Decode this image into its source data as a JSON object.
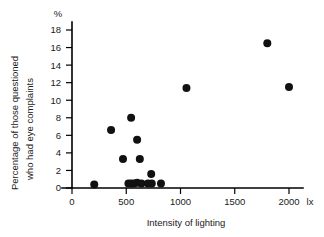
{
  "chart_data": {
    "type": "scatter",
    "title": "",
    "xlabel": "Intensity of lighting",
    "ylabel": "Percentage of those questioned who had eye complaints",
    "ylabel_line1": "Percentage of those questioned",
    "ylabel_line2": "who had eye complaints",
    "x_unit": "lx",
    "y_unit": "%",
    "xlim": [
      0,
      2150
    ],
    "ylim": [
      0,
      19
    ],
    "xticks": [
      0,
      500,
      1000,
      1500,
      2000
    ],
    "xtick_labels": [
      "0",
      "500",
      "1000",
      "1500",
      "2000"
    ],
    "yticks": [
      0,
      2,
      4,
      6,
      8,
      10,
      12,
      14,
      16,
      18
    ],
    "ytick_labels": [
      "0",
      "2",
      "4",
      "6",
      "8",
      "10",
      "12",
      "14",
      "16",
      "18"
    ],
    "grid": false,
    "legend": false,
    "marker": "filled-circle",
    "marker_color": "#111111",
    "marker_size": 5.2,
    "points": [
      {
        "x": 205,
        "y": 0.4
      },
      {
        "x": 360,
        "y": 6.6
      },
      {
        "x": 470,
        "y": 3.3
      },
      {
        "x": 545,
        "y": 8.0
      },
      {
        "x": 520,
        "y": 0.5
      },
      {
        "x": 545,
        "y": 0.5
      },
      {
        "x": 570,
        "y": 0.5
      },
      {
        "x": 600,
        "y": 0.6
      },
      {
        "x": 600,
        "y": 5.5
      },
      {
        "x": 625,
        "y": 3.3
      },
      {
        "x": 640,
        "y": 0.5
      },
      {
        "x": 700,
        "y": 0.5
      },
      {
        "x": 730,
        "y": 1.6
      },
      {
        "x": 735,
        "y": 0.5
      },
      {
        "x": 820,
        "y": 0.5
      },
      {
        "x": 1055,
        "y": 11.4
      },
      {
        "x": 1800,
        "y": 16.5
      },
      {
        "x": 2000,
        "y": 11.5
      }
    ]
  },
  "axes": {
    "y_unit_label": "%",
    "x_unit_label": "lx",
    "x_title": "Intensity of lighting",
    "y_title_line1": "Percentage of those questioned",
    "y_title_line2": "who had eye complaints"
  },
  "colors": {
    "background": "#ffffff",
    "axis": "#000000",
    "marker": "#111111",
    "text": "#1a1a1a"
  }
}
